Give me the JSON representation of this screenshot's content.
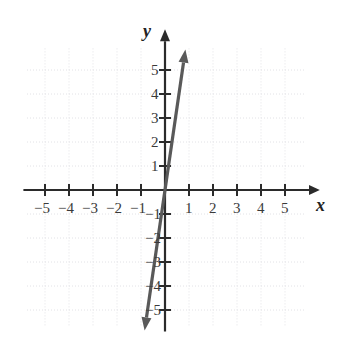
{
  "chart_data": {
    "type": "line",
    "title": "",
    "xlabel": "x",
    "ylabel": "y",
    "xlim": [
      -5.8,
      5.8
    ],
    "ylim": [
      -6.0,
      6.0
    ],
    "grid": true,
    "grid_style": "dotted",
    "legend": "none",
    "x_ticks": [
      -5,
      -4,
      -3,
      -2,
      -1,
      1,
      2,
      3,
      4,
      5
    ],
    "y_ticks": [
      5,
      4,
      3,
      2,
      1,
      -1,
      -2,
      -3,
      -4,
      -5
    ],
    "x_tick_labels": [
      "−5",
      "−4",
      "−3",
      "−2",
      "−1",
      "1",
      "2",
      "3",
      "4",
      "5"
    ],
    "y_tick_labels": [
      "5",
      "4",
      "3",
      "2",
      "1",
      "−1",
      "−2",
      "−3",
      "−4",
      "−5"
    ],
    "series": [
      {
        "name": "line",
        "type": "line",
        "slope": 7,
        "intercept": 0,
        "arrows": "both",
        "color": "#595959",
        "x": [
          -0.85,
          0.85
        ],
        "y": [
          -5.85,
          5.85
        ],
        "points": [
          {
            "x": -0.85,
            "y": -5.85
          },
          {
            "x": 0,
            "y": 0
          },
          {
            "x": 0.85,
            "y": 5.85
          }
        ]
      }
    ],
    "annotations": []
  },
  "axes": {
    "x_axis_label": "x",
    "y_axis_label": "y",
    "origin_label": ""
  },
  "colors": {
    "axis": "#2b2b2b",
    "grid": "#e2e2e6",
    "line": "#595959",
    "tick_text": "#3a3a3a",
    "background": "#ffffff"
  }
}
